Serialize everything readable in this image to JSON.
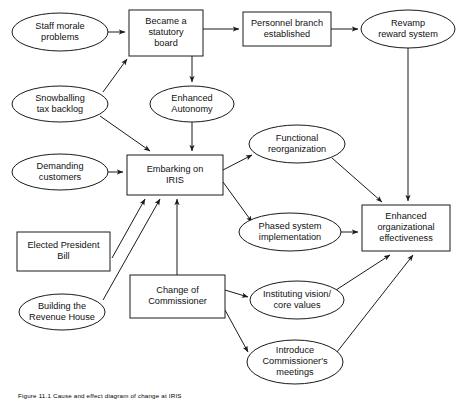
{
  "figure": {
    "caption": "Figure 11.1  Cause and effect diagram of change at IRIS",
    "background_color": "#ffffff",
    "line_color": "#1a1a1a",
    "text_color": "#111111"
  },
  "chart_data": {
    "type": "diagram",
    "title": "Cause and effect diagram of change at IRIS",
    "nodes": [
      {
        "id": "staff_morale",
        "label_lines": [
          "Staff morale",
          "problems"
        ],
        "shape": "ellipse",
        "cx": 60,
        "cy": 32,
        "rx": 48,
        "ry": 19
      },
      {
        "id": "statutory_board",
        "label_lines": [
          "Became a",
          "statutory",
          "board"
        ],
        "shape": "rect",
        "x": 129,
        "y": 10,
        "w": 74,
        "h": 46
      },
      {
        "id": "personnel_branch",
        "label_lines": [
          "Personnel branch",
          "established"
        ],
        "shape": "rect",
        "x": 243,
        "y": 12,
        "w": 88,
        "h": 34
      },
      {
        "id": "revamp_reward",
        "label_lines": [
          "Revamp",
          "reward system"
        ],
        "shape": "ellipse",
        "cx": 408,
        "cy": 29,
        "rx": 47,
        "ry": 19
      },
      {
        "id": "snowballing_tax",
        "label_lines": [
          "Snowballing",
          "tax backlog"
        ],
        "shape": "ellipse",
        "cx": 60,
        "cy": 104,
        "rx": 48,
        "ry": 18
      },
      {
        "id": "enhanced_autonomy",
        "label_lines": [
          "Enhanced",
          "Autonomy"
        ],
        "shape": "ellipse",
        "cx": 192,
        "cy": 104,
        "rx": 42,
        "ry": 18
      },
      {
        "id": "functional_reorg",
        "label_lines": [
          "Functional",
          "reorganization"
        ],
        "shape": "ellipse",
        "cx": 297,
        "cy": 144,
        "rx": 48,
        "ry": 19
      },
      {
        "id": "demanding_customers",
        "label_lines": [
          "Demanding",
          "customers"
        ],
        "shape": "ellipse",
        "cx": 60,
        "cy": 172,
        "rx": 48,
        "ry": 18
      },
      {
        "id": "embarking_iris",
        "label_lines": [
          "Embarking on",
          "IRIS"
        ],
        "shape": "rect",
        "x": 127,
        "y": 155,
        "w": 96,
        "h": 40
      },
      {
        "id": "phased_system",
        "label_lines": [
          "Phased system",
          "implementation"
        ],
        "shape": "ellipse",
        "cx": 290,
        "cy": 232,
        "rx": 51,
        "ry": 19
      },
      {
        "id": "enhanced_org",
        "label_lines": [
          "Enhanced",
          "organizational",
          "effectiveness"
        ],
        "shape": "rect",
        "x": 362,
        "y": 205,
        "w": 88,
        "h": 46
      },
      {
        "id": "elected_president",
        "label_lines": [
          "Elected President",
          "Bill"
        ],
        "shape": "rect",
        "x": 17,
        "y": 232,
        "w": 93,
        "h": 39
      },
      {
        "id": "change_commissioner",
        "label_lines": [
          "Change of",
          "Commissioner"
        ],
        "shape": "rect",
        "x": 130,
        "y": 275,
        "w": 95,
        "h": 43
      },
      {
        "id": "building_revenue",
        "label_lines": [
          "Building the",
          "Revenue House"
        ],
        "shape": "ellipse",
        "cx": 62,
        "cy": 312,
        "rx": 43,
        "ry": 18
      },
      {
        "id": "instituting_vision",
        "label_lines": [
          "Instituting vision/",
          "core values"
        ],
        "shape": "ellipse",
        "cx": 297,
        "cy": 300,
        "rx": 47,
        "ry": 19
      },
      {
        "id": "introduce_meetings",
        "label_lines": [
          "Introduce",
          "Commissioner's",
          "meetings"
        ],
        "shape": "ellipse",
        "cx": 295,
        "cy": 362,
        "rx": 48,
        "ry": 22
      }
    ],
    "edges": [
      {
        "from": "staff_morale",
        "to": "statutory_board",
        "points": "108,32 125,32"
      },
      {
        "from": "snowballing_tax",
        "to": "statutory_board",
        "points": "103,92 127,59"
      },
      {
        "from": "statutory_board",
        "to": "personnel_branch",
        "points": "203,29 239,29"
      },
      {
        "from": "personnel_branch",
        "to": "revamp_reward",
        "points": "331,29 358,29"
      },
      {
        "from": "statutory_board",
        "to": "enhanced_autonomy",
        "points": "192,56 192,82"
      },
      {
        "from": "enhanced_autonomy",
        "to": "embarking_iris",
        "points": "192,122 192,151"
      },
      {
        "from": "snowballing_tax",
        "to": "embarking_iris",
        "points": "100,116 150,151"
      },
      {
        "from": "demanding_customers",
        "to": "embarking_iris",
        "points": "108,172 123,172"
      },
      {
        "from": "elected_president",
        "to": "embarking_iris",
        "points": "112,258 145,199"
      },
      {
        "from": "building_revenue",
        "to": "embarking_iris",
        "points": "103,300 160,199"
      },
      {
        "from": "change_commissioner",
        "to": "embarking_iris",
        "points": "177,275 177,199"
      },
      {
        "from": "embarking_iris",
        "to": "functional_reorg",
        "points": "223,170 252,155"
      },
      {
        "from": "embarking_iris",
        "to": "phased_system",
        "points": "223,182 252,222"
      },
      {
        "from": "functional_reorg",
        "to": "enhanced_org",
        "points": "332,158 382,202"
      },
      {
        "from": "phased_system",
        "to": "enhanced_org",
        "points": "341,232 358,232"
      },
      {
        "from": "revamp_reward",
        "to": "enhanced_org",
        "points": "408,48 408,201"
      },
      {
        "from": "change_commissioner",
        "to": "instituting_vision",
        "points": "225,290 248,297"
      },
      {
        "from": "change_commissioner",
        "to": "introduce_meetings",
        "points": "225,310 248,352"
      },
      {
        "from": "instituting_vision",
        "to": "enhanced_org",
        "points": "336,290 390,255"
      },
      {
        "from": "introduce_meetings",
        "to": "enhanced_org",
        "points": "337,352 413,255"
      }
    ]
  }
}
